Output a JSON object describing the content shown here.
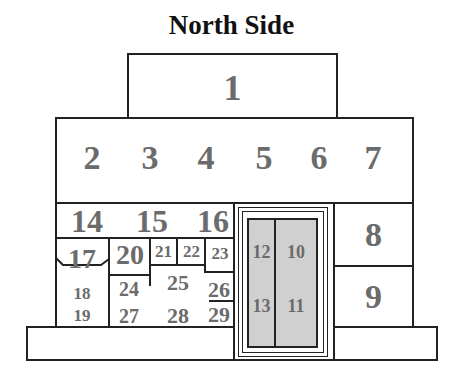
{
  "title": "North Side",
  "colors": {
    "line": "#222222",
    "number": "#6b6b6b",
    "door_fill": "#d0d0d0",
    "background": "#ffffff"
  },
  "sections": {
    "s1": "1",
    "s2": "2",
    "s3": "3",
    "s4": "4",
    "s5": "5",
    "s6": "6",
    "s7": "7",
    "s8": "8",
    "s9": "9",
    "s10": "10",
    "s11": "11",
    "s12": "12",
    "s13": "13",
    "s14": "14",
    "s15": "15",
    "s16": "16",
    "s17": "17",
    "s18": "18",
    "s19": "19",
    "s20": "20",
    "s21": "21",
    "s22": "22",
    "s23": "23",
    "s24": "24",
    "s25": "25",
    "s26": "26",
    "s27": "27",
    "s28": "28",
    "s29": "29"
  }
}
